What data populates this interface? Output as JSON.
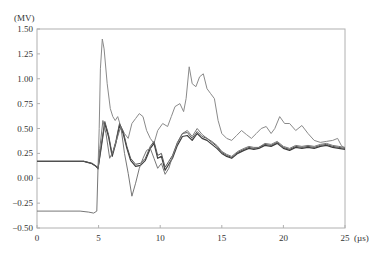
{
  "chart_data": {
    "type": "line",
    "title": "",
    "xlabel": "(µs)",
    "ylabel": "(MV)",
    "xlim": [
      0,
      25
    ],
    "ylim": [
      -0.5,
      1.5
    ],
    "x_ticks": [
      "0",
      "5",
      "10",
      "15",
      "20",
      "25"
    ],
    "y_ticks": [
      "1.50",
      "1.25",
      "1.00",
      "0.75",
      "0.50",
      "0.25",
      "0.00",
      "−0.25",
      "−0.50"
    ],
    "grid": false,
    "legend": null,
    "series": [
      {
        "name": "upper-waveform",
        "color": "#8a8a8a",
        "width": 1,
        "points": [
          [
            0,
            0.17
          ],
          [
            3.8,
            0.17
          ],
          [
            4.5,
            0.15
          ],
          [
            4.8,
            0.12
          ],
          [
            4.95,
            0.1
          ],
          [
            5.05,
            0.5
          ],
          [
            5.15,
            1.1
          ],
          [
            5.3,
            1.4
          ],
          [
            5.45,
            1.3
          ],
          [
            5.7,
            0.95
          ],
          [
            5.95,
            0.7
          ],
          [
            6.15,
            0.62
          ],
          [
            6.35,
            0.58
          ],
          [
            6.55,
            0.62
          ],
          [
            6.8,
            0.52
          ],
          [
            7.1,
            0.45
          ],
          [
            7.4,
            0.4
          ],
          [
            7.7,
            0.55
          ],
          [
            8.0,
            0.6
          ],
          [
            8.3,
            0.65
          ],
          [
            8.6,
            0.62
          ],
          [
            8.9,
            0.48
          ],
          [
            9.2,
            0.4
          ],
          [
            9.5,
            0.35
          ],
          [
            9.8,
            0.48
          ],
          [
            10.2,
            0.55
          ],
          [
            10.6,
            0.52
          ],
          [
            10.9,
            0.62
          ],
          [
            11.2,
            0.72
          ],
          [
            11.6,
            0.75
          ],
          [
            11.9,
            0.67
          ],
          [
            12.1,
            0.8
          ],
          [
            12.35,
            1.12
          ],
          [
            12.6,
            0.95
          ],
          [
            12.9,
            0.92
          ],
          [
            13.2,
            1.02
          ],
          [
            13.5,
            1.05
          ],
          [
            13.8,
            0.9
          ],
          [
            14.1,
            0.85
          ],
          [
            14.4,
            0.8
          ],
          [
            14.7,
            0.58
          ],
          [
            15.0,
            0.45
          ],
          [
            15.4,
            0.4
          ],
          [
            15.8,
            0.38
          ],
          [
            16.2,
            0.43
          ],
          [
            16.6,
            0.48
          ],
          [
            17.0,
            0.44
          ],
          [
            17.4,
            0.4
          ],
          [
            17.8,
            0.45
          ],
          [
            18.2,
            0.5
          ],
          [
            18.6,
            0.52
          ],
          [
            19.0,
            0.45
          ],
          [
            19.3,
            0.5
          ],
          [
            19.7,
            0.62
          ],
          [
            20.1,
            0.55
          ],
          [
            20.5,
            0.55
          ],
          [
            21.0,
            0.48
          ],
          [
            21.5,
            0.53
          ],
          [
            22.0,
            0.45
          ],
          [
            22.5,
            0.38
          ],
          [
            23.0,
            0.36
          ],
          [
            23.5,
            0.37
          ],
          [
            24.0,
            0.38
          ],
          [
            24.4,
            0.4
          ],
          [
            24.7,
            0.33
          ],
          [
            25.0,
            0.3
          ]
        ]
      },
      {
        "name": "middle-waveform-a",
        "color": "#3c3c3c",
        "width": 1.2,
        "points": [
          [
            0,
            0.17
          ],
          [
            3.8,
            0.17
          ],
          [
            4.4,
            0.15
          ],
          [
            4.8,
            0.12
          ],
          [
            4.95,
            0.1
          ],
          [
            5.2,
            0.3
          ],
          [
            5.5,
            0.55
          ],
          [
            5.8,
            0.42
          ],
          [
            6.1,
            0.22
          ],
          [
            6.4,
            0.35
          ],
          [
            6.7,
            0.53
          ],
          [
            7.0,
            0.45
          ],
          [
            7.3,
            0.3
          ],
          [
            7.6,
            0.18
          ],
          [
            8.0,
            0.12
          ],
          [
            8.4,
            0.13
          ],
          [
            8.8,
            0.18
          ],
          [
            9.2,
            0.3
          ],
          [
            9.5,
            0.35
          ],
          [
            9.8,
            0.2
          ],
          [
            10.1,
            0.22
          ],
          [
            10.4,
            0.08
          ],
          [
            10.7,
            0.14
          ],
          [
            11.0,
            0.2
          ],
          [
            11.4,
            0.33
          ],
          [
            11.8,
            0.42
          ],
          [
            12.2,
            0.43
          ],
          [
            12.6,
            0.38
          ],
          [
            13.0,
            0.45
          ],
          [
            13.4,
            0.4
          ],
          [
            13.8,
            0.38
          ],
          [
            14.2,
            0.34
          ],
          [
            14.6,
            0.3
          ],
          [
            15.0,
            0.25
          ],
          [
            15.4,
            0.22
          ],
          [
            15.8,
            0.2
          ],
          [
            16.3,
            0.25
          ],
          [
            16.8,
            0.28
          ],
          [
            17.2,
            0.3
          ],
          [
            17.6,
            0.29
          ],
          [
            18.0,
            0.3
          ],
          [
            18.5,
            0.33
          ],
          [
            19.0,
            0.32
          ],
          [
            19.5,
            0.35
          ],
          [
            20.0,
            0.3
          ],
          [
            20.5,
            0.28
          ],
          [
            21.0,
            0.31
          ],
          [
            21.5,
            0.3
          ],
          [
            22.0,
            0.31
          ],
          [
            22.5,
            0.3
          ],
          [
            23.0,
            0.32
          ],
          [
            23.5,
            0.33
          ],
          [
            24.0,
            0.31
          ],
          [
            24.5,
            0.3
          ],
          [
            25.0,
            0.29
          ]
        ]
      },
      {
        "name": "middle-waveform-b",
        "color": "#555555",
        "width": 1,
        "points": [
          [
            0,
            0.17
          ],
          [
            3.8,
            0.17
          ],
          [
            4.4,
            0.15
          ],
          [
            4.8,
            0.12
          ],
          [
            4.95,
            0.09
          ],
          [
            5.2,
            0.32
          ],
          [
            5.5,
            0.57
          ],
          [
            5.8,
            0.44
          ],
          [
            6.1,
            0.24
          ],
          [
            6.4,
            0.37
          ],
          [
            6.7,
            0.55
          ],
          [
            7.0,
            0.47
          ],
          [
            7.3,
            0.32
          ],
          [
            7.6,
            0.2
          ],
          [
            8.0,
            0.14
          ],
          [
            8.4,
            0.15
          ],
          [
            8.8,
            0.2
          ],
          [
            9.2,
            0.32
          ],
          [
            9.5,
            0.37
          ],
          [
            9.8,
            0.23
          ],
          [
            10.1,
            0.25
          ],
          [
            10.4,
            0.11
          ],
          [
            10.7,
            0.17
          ],
          [
            11.0,
            0.23
          ],
          [
            11.4,
            0.36
          ],
          [
            11.8,
            0.45
          ],
          [
            12.2,
            0.46
          ],
          [
            12.6,
            0.4
          ],
          [
            13.0,
            0.47
          ],
          [
            13.4,
            0.42
          ],
          [
            13.8,
            0.4
          ],
          [
            14.2,
            0.36
          ],
          [
            14.6,
            0.32
          ],
          [
            15.0,
            0.26
          ],
          [
            15.4,
            0.23
          ],
          [
            15.8,
            0.21
          ],
          [
            16.3,
            0.26
          ],
          [
            16.8,
            0.29
          ],
          [
            17.2,
            0.31
          ],
          [
            17.6,
            0.3
          ],
          [
            18.0,
            0.31
          ],
          [
            18.5,
            0.34
          ],
          [
            19.0,
            0.33
          ],
          [
            19.5,
            0.36
          ],
          [
            20.0,
            0.31
          ],
          [
            20.5,
            0.29
          ],
          [
            21.0,
            0.32
          ],
          [
            21.5,
            0.31
          ],
          [
            22.0,
            0.32
          ],
          [
            22.5,
            0.31
          ],
          [
            23.0,
            0.33
          ],
          [
            23.5,
            0.34
          ],
          [
            24.0,
            0.32
          ],
          [
            24.5,
            0.31
          ],
          [
            25.0,
            0.3
          ]
        ]
      },
      {
        "name": "lower-waveform",
        "color": "#777777",
        "width": 1,
        "points": [
          [
            0,
            -0.33
          ],
          [
            3.5,
            -0.33
          ],
          [
            4.2,
            -0.34
          ],
          [
            4.6,
            -0.35
          ],
          [
            4.85,
            -0.33
          ],
          [
            4.95,
            0.1
          ],
          [
            5.1,
            0.3
          ],
          [
            5.35,
            0.58
          ],
          [
            5.6,
            0.45
          ],
          [
            5.9,
            0.2
          ],
          [
            6.2,
            0.28
          ],
          [
            6.5,
            0.4
          ],
          [
            6.8,
            0.52
          ],
          [
            7.1,
            0.25
          ],
          [
            7.4,
            0.05
          ],
          [
            7.7,
            -0.18
          ],
          [
            8.0,
            -0.05
          ],
          [
            8.3,
            0.1
          ],
          [
            8.6,
            0.2
          ],
          [
            8.9,
            0.28
          ],
          [
            9.2,
            0.3
          ],
          [
            9.5,
            0.2
          ],
          [
            9.8,
            0.1
          ],
          [
            10.1,
            0.15
          ],
          [
            10.4,
            0.04
          ],
          [
            10.7,
            0.1
          ],
          [
            11.0,
            0.22
          ],
          [
            11.4,
            0.35
          ],
          [
            11.8,
            0.45
          ],
          [
            12.2,
            0.48
          ],
          [
            12.6,
            0.42
          ],
          [
            13.0,
            0.5
          ],
          [
            13.4,
            0.44
          ],
          [
            13.8,
            0.4
          ],
          [
            14.2,
            0.37
          ],
          [
            14.6,
            0.33
          ],
          [
            15.0,
            0.27
          ],
          [
            15.4,
            0.24
          ],
          [
            15.8,
            0.22
          ],
          [
            16.3,
            0.27
          ],
          [
            16.8,
            0.3
          ],
          [
            17.2,
            0.32
          ],
          [
            17.6,
            0.31
          ],
          [
            18.0,
            0.31
          ],
          [
            18.5,
            0.35
          ],
          [
            19.0,
            0.34
          ],
          [
            19.5,
            0.37
          ],
          [
            20.0,
            0.32
          ],
          [
            20.5,
            0.3
          ],
          [
            21.0,
            0.33
          ],
          [
            21.5,
            0.32
          ],
          [
            22.0,
            0.33
          ],
          [
            22.5,
            0.32
          ],
          [
            23.0,
            0.34
          ],
          [
            23.5,
            0.35
          ],
          [
            24.0,
            0.33
          ],
          [
            24.5,
            0.32
          ],
          [
            25.0,
            0.31
          ]
        ]
      }
    ]
  },
  "axes": {
    "y_unit": "(MV)",
    "x_unit": "(µs)"
  }
}
